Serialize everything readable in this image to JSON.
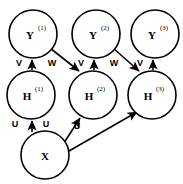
{
  "diagram": {
    "type": "directed-graph",
    "background_color": "#ffffff",
    "stroke_color": "#000000",
    "node_fill": "#ffffff",
    "canvas": {
      "width": 183,
      "height": 184
    },
    "nodes": [
      {
        "id": "y1",
        "base": "Y",
        "superscript": "(1)",
        "label": "Y(1)",
        "cx": 33,
        "cy": 34,
        "r": 24,
        "row": "output"
      },
      {
        "id": "y2",
        "base": "Y",
        "superscript": "(2)",
        "label": "Y(2)",
        "cx": 96,
        "cy": 34,
        "r": 24,
        "row": "output"
      },
      {
        "id": "y3",
        "base": "Y",
        "superscript": "(3)",
        "label": "Y(3)",
        "cx": 155,
        "cy": 34,
        "r": 24,
        "row": "output"
      },
      {
        "id": "h1",
        "base": "H",
        "superscript": "(1)",
        "label": "H(1)",
        "cx": 31,
        "cy": 95,
        "r": 24,
        "row": "hidden"
      },
      {
        "id": "h2",
        "base": "H",
        "superscript": "(2)",
        "label": "H(2)",
        "cx": 93,
        "cy": 95,
        "r": 24,
        "row": "hidden"
      },
      {
        "id": "h3",
        "base": "H",
        "superscript": "(3)",
        "label": "H(3)",
        "cx": 152,
        "cy": 95,
        "r": 24,
        "row": "hidden"
      },
      {
        "id": "x",
        "base": "X",
        "superscript": "",
        "label": "X",
        "cx": 45,
        "cy": 155,
        "r": 24,
        "row": "input"
      }
    ],
    "edges": [
      {
        "id": "h1-y1",
        "from": "h1",
        "to": "y1",
        "label": "V",
        "label_x": 19,
        "label_y": 63
      },
      {
        "id": "h2-y2",
        "from": "h2",
        "to": "y2",
        "label": "V",
        "label_x": 81,
        "label_y": 63
      },
      {
        "id": "h3-y3",
        "from": "h3",
        "to": "y3",
        "label": "V",
        "label_x": 140,
        "label_y": 63
      },
      {
        "id": "y1-h2",
        "from": "y1",
        "to": "h2",
        "label": "W",
        "label_x": 51,
        "label_y": 63
      },
      {
        "id": "y2-h3",
        "from": "y2",
        "to": "h3",
        "label": "W",
        "label_x": 113,
        "label_y": 63
      },
      {
        "id": "x-h1",
        "from": "x",
        "to": "h1",
        "label": "U",
        "label_x": 15,
        "label_y": 124
      },
      {
        "id": "x-h2",
        "from": "x",
        "to": "h2",
        "label": "U",
        "label_x": 45,
        "label_y": 124
      },
      {
        "id": "x-h3",
        "from": "x",
        "to": "h3",
        "label": "U",
        "label_x": 76,
        "label_y": 126
      }
    ],
    "weight_labels": {
      "input_to_hidden": "U",
      "hidden_to_output": "V",
      "recurrent": "W"
    }
  }
}
